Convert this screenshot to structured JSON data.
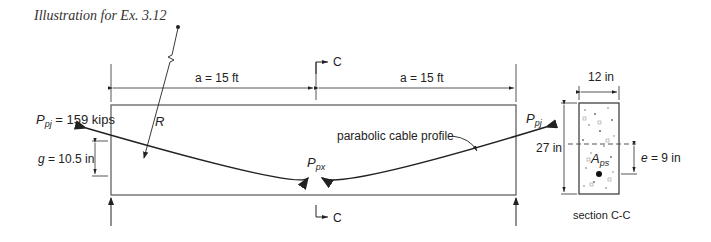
{
  "caption": "Illustration for Ex. 3.12",
  "beam": {
    "dim_left": "a = 15 ft",
    "dim_right": "a = 15 ft",
    "force_left_label": "P",
    "force_left_sub": "pj",
    "force_left_value": " = 159 kips",
    "force_right_label": "P",
    "force_right_sub": "pj",
    "force_mid_label": "P",
    "force_mid_sub": "px",
    "radius_label": "R",
    "sag_label": "g = 10.5 in",
    "cable_label": "parabolic cable profile",
    "section_mark_top": "C",
    "section_mark_bottom": "C"
  },
  "section": {
    "width_label": "12 in",
    "height_label": "27 in",
    "ecc_label": "e = 9 in",
    "area_label": "A",
    "area_sub": "ps",
    "title": "section C-C"
  }
}
